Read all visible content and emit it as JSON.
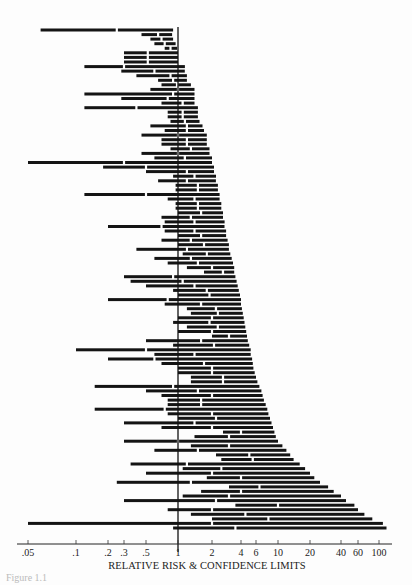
{
  "chart_data": {
    "type": "forest",
    "title": "",
    "xlabel": "RELATIVE RISK & CONFIDENCE LIMITS",
    "ylabel": "",
    "xscale": "log",
    "xlim": [
      0.04,
      130
    ],
    "reference_line": 1,
    "grid": false,
    "legend": null,
    "ticks": [
      {
        "label": ".05",
        "value": 0.05,
        "px": 27
      },
      {
        "label": ".1",
        "value": 0.1,
        "px": 75
      },
      {
        "label": ".2",
        "value": 0.2,
        "px": 107
      },
      {
        "label": ".3",
        "value": 0.3,
        "px": 123
      },
      {
        "label": ".5",
        "value": 0.5,
        "px": 145
      },
      {
        "label": "1",
        "value": 1,
        "px": 177
      },
      {
        "label": "2",
        "value": 2,
        "px": 211
      },
      {
        "label": "4",
        "value": 4,
        "px": 240
      },
      {
        "label": "6",
        "value": 6,
        "px": 255
      },
      {
        "label": "10",
        "value": 10,
        "px": 277
      },
      {
        "label": "20",
        "value": 20,
        "px": 309
      },
      {
        "label": "40",
        "value": 40,
        "px": 340
      },
      {
        "label": "60",
        "value": 60,
        "px": 357
      },
      {
        "label": "100",
        "value": 100,
        "px": 378
      }
    ],
    "note": "Each interval: [lower, point_estimate, upper] relative risk, sorted by upper limit (top to bottom). Values estimated from pixel positions.",
    "intervals": [
      [
        0.06,
        0.25,
        0.9
      ],
      [
        0.45,
        0.65,
        0.88
      ],
      [
        0.55,
        0.7,
        0.9
      ],
      [
        0.6,
        0.75,
        0.95
      ],
      [
        0.75,
        0.85,
        0.98
      ],
      [
        0.3,
        0.52,
        1.0
      ],
      [
        0.3,
        0.52,
        1.0
      ],
      [
        0.3,
        0.52,
        1.0
      ],
      [
        0.12,
        0.3,
        1.15
      ],
      [
        0.28,
        0.6,
        1.15
      ],
      [
        0.4,
        0.85,
        1.2
      ],
      [
        0.65,
        0.9,
        1.2
      ],
      [
        0.7,
        0.98,
        1.3
      ],
      [
        0.55,
        1.0,
        1.4
      ],
      [
        0.12,
        0.9,
        1.4
      ],
      [
        0.28,
        0.8,
        1.4
      ],
      [
        0.7,
        1.1,
        1.4
      ],
      [
        0.12,
        0.4,
        1.5
      ],
      [
        0.8,
        1.1,
        1.5
      ],
      [
        0.8,
        1.1,
        1.5
      ],
      [
        0.85,
        1.15,
        1.55
      ],
      [
        0.55,
        1.2,
        1.65
      ],
      [
        0.75,
        1.2,
        1.7
      ],
      [
        0.45,
        1.0,
        1.8
      ],
      [
        0.7,
        1.2,
        1.8
      ],
      [
        0.7,
        1.2,
        1.8
      ],
      [
        0.85,
        1.3,
        1.9
      ],
      [
        0.45,
        1.0,
        1.9
      ],
      [
        0.6,
        1.15,
        2.0
      ],
      [
        0.05,
        0.3,
        2.0
      ],
      [
        0.18,
        0.5,
        2.1
      ],
      [
        0.5,
        1.2,
        2.1
      ],
      [
        0.9,
        1.4,
        2.2
      ],
      [
        0.65,
        1.2,
        2.2
      ],
      [
        0.95,
        1.5,
        2.3
      ],
      [
        0.95,
        1.5,
        2.3
      ],
      [
        0.12,
        0.5,
        2.4
      ],
      [
        0.8,
        1.4,
        2.4
      ],
      [
        0.95,
        1.5,
        2.5
      ],
      [
        0.95,
        1.5,
        2.5
      ],
      [
        1.0,
        1.6,
        2.6
      ],
      [
        0.7,
        1.3,
        2.6
      ],
      [
        0.75,
        1.4,
        2.7
      ],
      [
        0.2,
        0.7,
        2.7
      ],
      [
        0.75,
        1.4,
        2.8
      ],
      [
        1.0,
        1.6,
        2.8
      ],
      [
        0.7,
        1.3,
        2.9
      ],
      [
        1.0,
        1.7,
        3.0
      ],
      [
        0.4,
        1.2,
        3.0
      ],
      [
        1.1,
        1.8,
        3.1
      ],
      [
        0.6,
        1.3,
        3.2
      ],
      [
        0.8,
        1.5,
        3.3
      ],
      [
        1.2,
        2.0,
        3.4
      ],
      [
        1.7,
        2.6,
        3.4
      ],
      [
        0.3,
        0.9,
        3.5
      ],
      [
        0.35,
        1.1,
        3.6
      ],
      [
        0.5,
        1.4,
        3.7
      ],
      [
        0.9,
        1.8,
        3.8
      ],
      [
        1.0,
        1.9,
        3.9
      ],
      [
        0.2,
        0.8,
        4.0
      ],
      [
        0.75,
        1.6,
        4.0
      ],
      [
        1.2,
        2.2,
        4.1
      ],
      [
        1.3,
        2.3,
        4.2
      ],
      [
        1.0,
        2.0,
        4.3
      ],
      [
        0.9,
        1.9,
        4.4
      ],
      [
        1.2,
        2.3,
        4.5
      ],
      [
        1.0,
        2.0,
        4.6
      ],
      [
        2.0,
        3.0,
        4.7
      ],
      [
        0.5,
        1.6,
        4.8
      ],
      [
        0.9,
        2.1,
        5.0
      ],
      [
        0.1,
        0.5,
        5.2
      ],
      [
        0.6,
        1.4,
        5.2
      ],
      [
        0.2,
        0.6,
        5.4
      ],
      [
        0.7,
        1.7,
        5.5
      ],
      [
        1.0,
        2.0,
        5.6
      ],
      [
        1.0,
        2.0,
        5.8
      ],
      [
        1.3,
        2.6,
        6.0
      ],
      [
        1.3,
        2.6,
        6.2
      ],
      [
        0.15,
        0.9,
        6.5
      ],
      [
        0.5,
        1.5,
        6.8
      ],
      [
        0.7,
        2.0,
        7.0
      ],
      [
        0.8,
        1.6,
        7.2
      ],
      [
        0.8,
        1.6,
        7.5
      ],
      [
        0.15,
        0.75,
        7.8
      ],
      [
        0.8,
        2.0,
        8.0
      ],
      [
        1.0,
        2.2,
        8.3
      ],
      [
        0.3,
        1.4,
        8.6
      ],
      [
        0.7,
        2.0,
        8.9
      ],
      [
        2.6,
        4.0,
        9.2
      ],
      [
        1.4,
        3.0,
        9.5
      ],
      [
        0.3,
        1.0,
        10
      ],
      [
        1.3,
        3.0,
        11
      ],
      [
        0.6,
        1.5,
        12
      ],
      [
        2.2,
        5.0,
        13
      ],
      [
        2.5,
        5.5,
        14
      ],
      [
        0.35,
        1.2,
        16
      ],
      [
        1.1,
        2.5,
        18
      ],
      [
        0.5,
        2.0,
        20
      ],
      [
        1.8,
        4.0,
        22
      ],
      [
        0.25,
        1.3,
        25
      ],
      [
        3.0,
        6.5,
        30
      ],
      [
        1.6,
        4.0,
        34
      ],
      [
        1.1,
        3.0,
        40
      ],
      [
        0.3,
        2.2,
        45
      ],
      [
        3.5,
        10,
        55
      ],
      [
        0.8,
        2.0,
        60
      ],
      [
        1.3,
        4.5,
        70
      ],
      [
        2.0,
        8.0,
        85
      ],
      [
        0.05,
        2.0,
        110
      ],
      [
        0.9,
        3.5,
        120
      ]
    ]
  },
  "axis": {
    "xlabel": "RELATIVE RISK & CONFIDENCE LIMITS"
  },
  "caption": {
    "text": "Figure 1.1"
  }
}
